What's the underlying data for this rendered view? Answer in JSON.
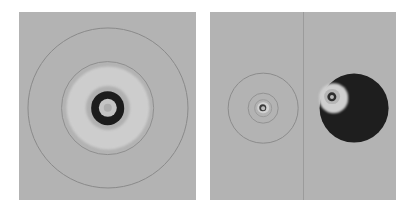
{
  "figure": {
    "background": "#ffffff",
    "width": 414,
    "height": 209,
    "panel_fill": "#b3b3b3",
    "panel_border": "#a8a8a8",
    "label": "two-panel concentric ring field map"
  },
  "panels": [
    {
      "name": "left-panel",
      "x": 19,
      "y": 12,
      "width": 177,
      "height": 188,
      "fill": "#b3b3b3",
      "divider": null,
      "features": [
        {
          "name": "outer-contour-ring",
          "cx": 50,
          "cy": 51,
          "r": 45.5,
          "kind": "ring",
          "stroke": "#8a8a8a",
          "stroke_width": 0.8,
          "fill": "transparent",
          "blur": "soft"
        },
        {
          "name": "mid-contour-ring",
          "cx": 50,
          "cy": 51,
          "r": 26.5,
          "kind": "ring",
          "stroke": "#8f8f8f",
          "stroke_width": 0.8,
          "fill": "transparent",
          "blur": "soft"
        },
        {
          "name": "bright-annulus-disc",
          "cx": 50,
          "cy": 51,
          "r": 23.5,
          "kind": "disc",
          "fill": "#cdcdcd",
          "blur": "softer"
        },
        {
          "name": "inner-gray-disc",
          "cx": 50,
          "cy": 51,
          "r": 12.5,
          "kind": "disc",
          "fill": "#b0b0b0",
          "blur": "softer"
        },
        {
          "name": "dark-core-ring",
          "cx": 50,
          "cy": 51,
          "r": 9.5,
          "kind": "disc",
          "fill": "#1c1c1c",
          "blur": "soft"
        },
        {
          "name": "core-halo-disc",
          "cx": 50,
          "cy": 51,
          "r": 5.2,
          "kind": "disc",
          "fill": "#c4c4c4",
          "blur": "soft"
        },
        {
          "name": "core-center-dot",
          "cx": 50,
          "cy": 51,
          "r": 2.4,
          "kind": "disc",
          "fill": "#adadad",
          "blur": "soft"
        }
      ]
    },
    {
      "name": "right-panel",
      "x": 210,
      "y": 12,
      "width": 186,
      "height": 188,
      "fill": "#b3b3b3",
      "divider": {
        "name": "panel-split-divider",
        "x_pct": 50,
        "color": "#9b9b9b",
        "width_px": 1
      },
      "subpanels": [
        {
          "name": "right-panel-left-half",
          "x_pct": 0,
          "width_pct": 50,
          "features": [
            {
              "name": "outer-contour-ring",
              "cx": 57,
              "cy": 51,
              "r": 38,
              "kind": "ring",
              "stroke": "#8c8c8c",
              "stroke_width": 0.8,
              "fill": "transparent",
              "blur": "soft"
            },
            {
              "name": "mid-contour-ring",
              "cx": 57,
              "cy": 51,
              "r": 16.5,
              "kind": "ring",
              "stroke": "#929292",
              "stroke_width": 0.8,
              "fill": "transparent",
              "blur": "soft"
            },
            {
              "name": "inner-contour-ring",
              "cx": 57,
              "cy": 51,
              "r": 9.5,
              "kind": "ring",
              "stroke": "#9a9a9a",
              "stroke_width": 0.8,
              "fill": "transparent",
              "blur": "soft"
            },
            {
              "name": "bright-core-disc",
              "cx": 57,
              "cy": 51,
              "r": 6.2,
              "kind": "disc",
              "fill": "#d2d2d2",
              "blur": "soft"
            },
            {
              "name": "dark-core-ring",
              "cx": 57,
              "cy": 51,
              "r": 4.0,
              "kind": "disc",
              "fill": "#3a3a3a",
              "blur": "soft"
            },
            {
              "name": "core-center-dot",
              "cx": 57,
              "cy": 51,
              "r": 2.0,
              "kind": "disc",
              "fill": "#bdbdbd",
              "blur": "soft"
            }
          ]
        },
        {
          "name": "right-panel-right-half",
          "x_pct": 50,
          "width_pct": 50,
          "features": [
            {
              "name": "dark-filled-disc",
              "cx": 55,
              "cy": 51,
              "r": 37,
              "kind": "disc",
              "fill": "#1e1e1e",
              "blur": "soft"
            },
            {
              "name": "bright-offset-disc",
              "cx": 33,
              "cy": 46,
              "r": 16,
              "kind": "disc",
              "fill": "#cfcfcf",
              "blur": "softer"
            },
            {
              "name": "inner-gray-disc",
              "cx": 31,
              "cy": 45,
              "r": 8.5,
              "kind": "disc",
              "fill": "#b6b6b6",
              "blur": "soft"
            },
            {
              "name": "dark-core-ring",
              "cx": 31,
              "cy": 45,
              "r": 5.0,
              "kind": "disc",
              "fill": "#2e2e2e",
              "blur": "soft"
            },
            {
              "name": "core-center-dot",
              "cx": 31,
              "cy": 45,
              "r": 2.2,
              "kind": "disc",
              "fill": "#b9b9b9",
              "blur": "soft"
            }
          ]
        }
      ]
    }
  ]
}
